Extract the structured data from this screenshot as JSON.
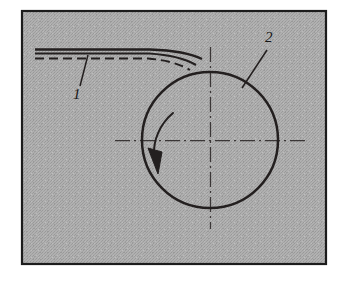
{
  "figure": {
    "canvas": {
      "width": 348,
      "height": 283
    },
    "background_color": "#ffffff",
    "panel": {
      "name": "illustration-panel",
      "fill_color": "#a9a9a9",
      "texture": "halftone-dither-gray",
      "border_color": "#1c1c1c",
      "border_width": 2,
      "x": 21,
      "y": 10,
      "width": 306,
      "height": 255
    },
    "ink_color": "#231f1f",
    "centerline_color": "#2a2626"
  },
  "parts": [
    {
      "id": "1",
      "label": "1",
      "name": "strip-workpiece",
      "description": "sheet strip fed onto roller",
      "label_x": 78,
      "label_y": 98,
      "leader_from": {
        "x": 88,
        "y": 57
      },
      "leader_to": {
        "x": 80,
        "y": 86
      }
    },
    {
      "id": "2",
      "label": "2",
      "name": "roller-drum",
      "description": "rotating roller",
      "label_x": 271,
      "label_y": 42,
      "leader_from": {
        "x": 266,
        "y": 48
      },
      "leader_to": {
        "x": 243,
        "y": 86
      }
    }
  ],
  "roller": {
    "name": "roller-circle",
    "center_x": 210,
    "center_y": 140,
    "radius": 68,
    "stroke_width": 2.4,
    "rotation": {
      "name": "rotation-arrow",
      "direction": "counterclockwise",
      "arc_start_angle_deg": 222,
      "arc_end_angle_deg": 160,
      "arrow_tip": {
        "x": 160,
        "y": 166
      }
    }
  },
  "centerlines": {
    "horizontal": {
      "name": "horizontal-centerline",
      "x1": 115,
      "y1": 140,
      "x2": 305,
      "y2": 140,
      "style": "dash-dot"
    },
    "vertical": {
      "name": "vertical-centerline",
      "x1": 210,
      "y1": 47,
      "x2": 210,
      "y2": 229,
      "style": "dash-dot"
    }
  },
  "strip": {
    "name": "strip-body",
    "top_edge_y": 49,
    "bottom_edge_y": 53,
    "center_dash_y": 58,
    "left_x": 35,
    "bend_start_x": 150,
    "tangent_point": {
      "x": 202,
      "y": 59
    },
    "stroke_width": 2.2,
    "center_dash_style": "dashed"
  }
}
